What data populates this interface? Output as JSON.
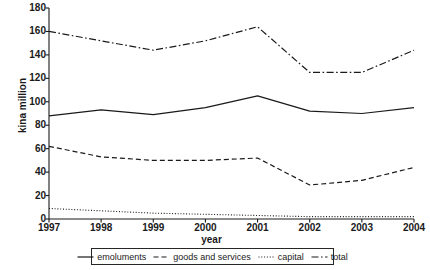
{
  "chart_data": {
    "type": "line",
    "title": "",
    "xlabel": "year",
    "ylabel": "kina million",
    "categories": [
      "1997",
      "1998",
      "1999",
      "2000",
      "2001",
      "2002",
      "2003",
      "2004"
    ],
    "x": [
      1997,
      1998,
      1999,
      2000,
      2001,
      2002,
      2003,
      2004
    ],
    "ylim": [
      0,
      180
    ],
    "xlim": [
      1997,
      2004
    ],
    "yticks": [
      0,
      20,
      40,
      60,
      80,
      100,
      120,
      140,
      160,
      180
    ],
    "grid": false,
    "legend_position": "bottom",
    "series": [
      {
        "name": "emoluments",
        "style": "solid",
        "color": "#1a1a1a",
        "values": [
          88,
          93,
          89,
          95,
          105,
          92,
          90,
          95
        ]
      },
      {
        "name": "goods and services",
        "style": "dashed",
        "color": "#1a1a1a",
        "values": [
          62,
          53,
          50,
          50,
          52,
          29,
          33,
          44
        ]
      },
      {
        "name": "capital",
        "style": "dotted",
        "color": "#1a1a1a",
        "values": [
          9,
          7,
          5,
          4,
          3,
          2,
          2,
          2
        ]
      },
      {
        "name": "total",
        "style": "dashdot",
        "color": "#1a1a1a",
        "values": [
          160,
          152,
          144,
          152,
          164,
          125,
          125,
          144
        ]
      }
    ]
  },
  "axes": {
    "y_title": "kina million",
    "x_title": "year",
    "y_tick_labels": [
      "180",
      "160",
      "140",
      "120",
      "100",
      "80",
      "60",
      "40",
      "20",
      "0"
    ],
    "x_tick_labels": [
      "1997",
      "1998",
      "1999",
      "2000",
      "2001",
      "2002",
      "2003",
      "2004"
    ]
  },
  "legend": {
    "items": [
      {
        "label": "emoluments",
        "style": "solid"
      },
      {
        "label": "goods and services",
        "style": "dashed"
      },
      {
        "label": "capital",
        "style": "dotted"
      },
      {
        "label": "total",
        "style": "dashdot"
      }
    ]
  }
}
